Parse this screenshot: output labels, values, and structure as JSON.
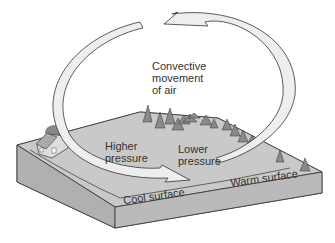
{
  "diagram": {
    "title_label": "Convective\nmovement\nof air",
    "labels": {
      "higher_pressure": "Higher\npressure",
      "lower_pressure": "Lower\npressure",
      "cool_surface": "Cool surface",
      "warm_surface": "Warm surface"
    },
    "colors": {
      "ground_top": "#c9c9c9",
      "ground_side": "#b5b5b5",
      "ground_front": "#a8a8a8",
      "arrow_fill": "#eeeeee",
      "outline": "#333333",
      "trees": "#8a8a8a"
    }
  }
}
